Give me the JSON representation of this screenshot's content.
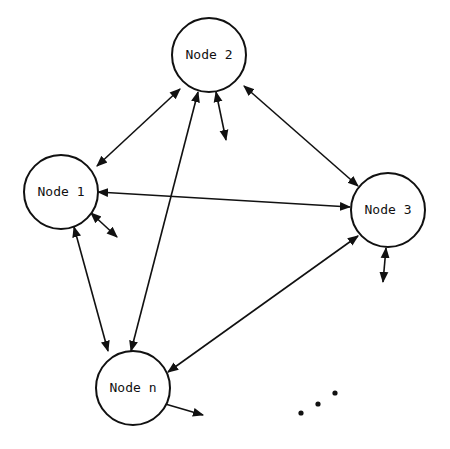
{
  "diagram": {
    "type": "fully-connected network",
    "colors": {
      "stroke": "#111111",
      "background": "#ffffff"
    },
    "nodes": [
      {
        "id": "node2",
        "label": "Node 2",
        "cx": 209,
        "cy": 55,
        "r": 37
      },
      {
        "id": "node1",
        "label": "Node 1",
        "cx": 61,
        "cy": 192,
        "r": 37
      },
      {
        "id": "node3",
        "label": "Node 3",
        "cx": 388,
        "cy": 210,
        "r": 37
      },
      {
        "id": "noden",
        "label": "Node n",
        "cx": 133,
        "cy": 388,
        "r": 37
      }
    ],
    "edges": [
      {
        "from": "node1",
        "to": "node2",
        "bidirectional": true,
        "x1": 97,
        "y1": 166,
        "x2": 180,
        "y2": 89
      },
      {
        "from": "node2",
        "to": "node3",
        "bidirectional": true,
        "x1": 244,
        "y1": 86,
        "x2": 358,
        "y2": 186
      },
      {
        "from": "node1",
        "to": "node3",
        "bidirectional": true,
        "x1": 98,
        "y1": 192,
        "x2": 350,
        "y2": 207
      },
      {
        "from": "node1",
        "to": "noden",
        "bidirectional": true,
        "x1": 74,
        "y1": 227,
        "x2": 108,
        "y2": 351
      },
      {
        "from": "node2",
        "to": "noden",
        "bidirectional": true,
        "x1": 198,
        "y1": 92,
        "x2": 131,
        "y2": 351
      },
      {
        "from": "node3",
        "to": "noden",
        "bidirectional": true,
        "x1": 358,
        "y1": 236,
        "x2": 168,
        "y2": 372
      }
    ],
    "external_links": [
      {
        "node": "node2",
        "x1": 216,
        "y1": 92,
        "x2": 226,
        "y2": 140
      },
      {
        "node": "node1",
        "x1": 91,
        "y1": 213,
        "x2": 117,
        "y2": 237
      },
      {
        "node": "node3",
        "x1": 386,
        "y1": 248,
        "x2": 383,
        "y2": 282
      },
      {
        "node": "noden",
        "x1": 155,
        "y1": 401,
        "x2": 203,
        "y2": 415
      }
    ],
    "ellipsis": [
      {
        "cx": 301,
        "cy": 413
      },
      {
        "cx": 318,
        "cy": 404
      },
      {
        "cx": 335,
        "cy": 393
      }
    ]
  }
}
